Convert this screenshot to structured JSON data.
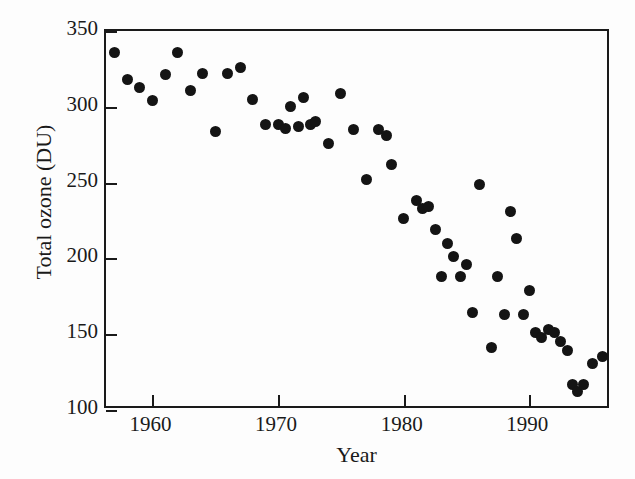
{
  "figure": {
    "background_color": "#fdfdfd",
    "ink_color": "#141414"
  },
  "chart_data": {
    "type": "scatter",
    "title": "",
    "subtitle": "",
    "xlabel": "Year",
    "ylabel": "Total ozone (DU)",
    "xlim": [
      1956.3,
      1996.5
    ],
    "ylim": [
      100,
      350
    ],
    "xticks": [
      1960,
      1970,
      1980,
      1990
    ],
    "xtick_labels": [
      "1960",
      "1970",
      "1980",
      "1990"
    ],
    "yticks": [
      100,
      150,
      200,
      250,
      300,
      350
    ],
    "ytick_labels": [
      "100",
      "150",
      "200",
      "250",
      "300",
      "350"
    ],
    "grid": false,
    "legend": null,
    "marker": {
      "shape": "circle",
      "color": "#141414",
      "size_px": 11
    },
    "annotations": [],
    "series": [
      {
        "name": "Total ozone",
        "units": "DU",
        "x": [
          1957,
          1958,
          1959,
          1960,
          1961,
          1962,
          1963,
          1964,
          1965,
          1966,
          1967,
          1968,
          1969,
          1970,
          1970.6,
          1971,
          1971.6,
          1972,
          1972.6,
          1973,
          1974,
          1975,
          1976,
          1977,
          1978,
          1978.6,
          1979,
          1980,
          1981,
          1981.5,
          1982,
          1982.5,
          1983,
          1983.5,
          1984,
          1984.5,
          1985,
          1985.5,
          1986,
          1987,
          1987.5,
          1988,
          1988.5,
          1989,
          1989.5,
          1990,
          1990.5,
          1991,
          1991.5,
          1992,
          1992.5,
          1993,
          1993.4,
          1993.8,
          1994.3,
          1995,
          1995.8
        ],
        "y": [
          336,
          318,
          313,
          304,
          321,
          336,
          311,
          322,
          284,
          322,
          326,
          305,
          288,
          288,
          286,
          300,
          287,
          306,
          288,
          290,
          276,
          309,
          285,
          252,
          285,
          281,
          262,
          226,
          238,
          233,
          234,
          219,
          188,
          210,
          201,
          188,
          196,
          164,
          249,
          141,
          188,
          163,
          231,
          213,
          163,
          179,
          151,
          148,
          153,
          151,
          145,
          139,
          117,
          112,
          117,
          131,
          135
        ]
      }
    ]
  }
}
